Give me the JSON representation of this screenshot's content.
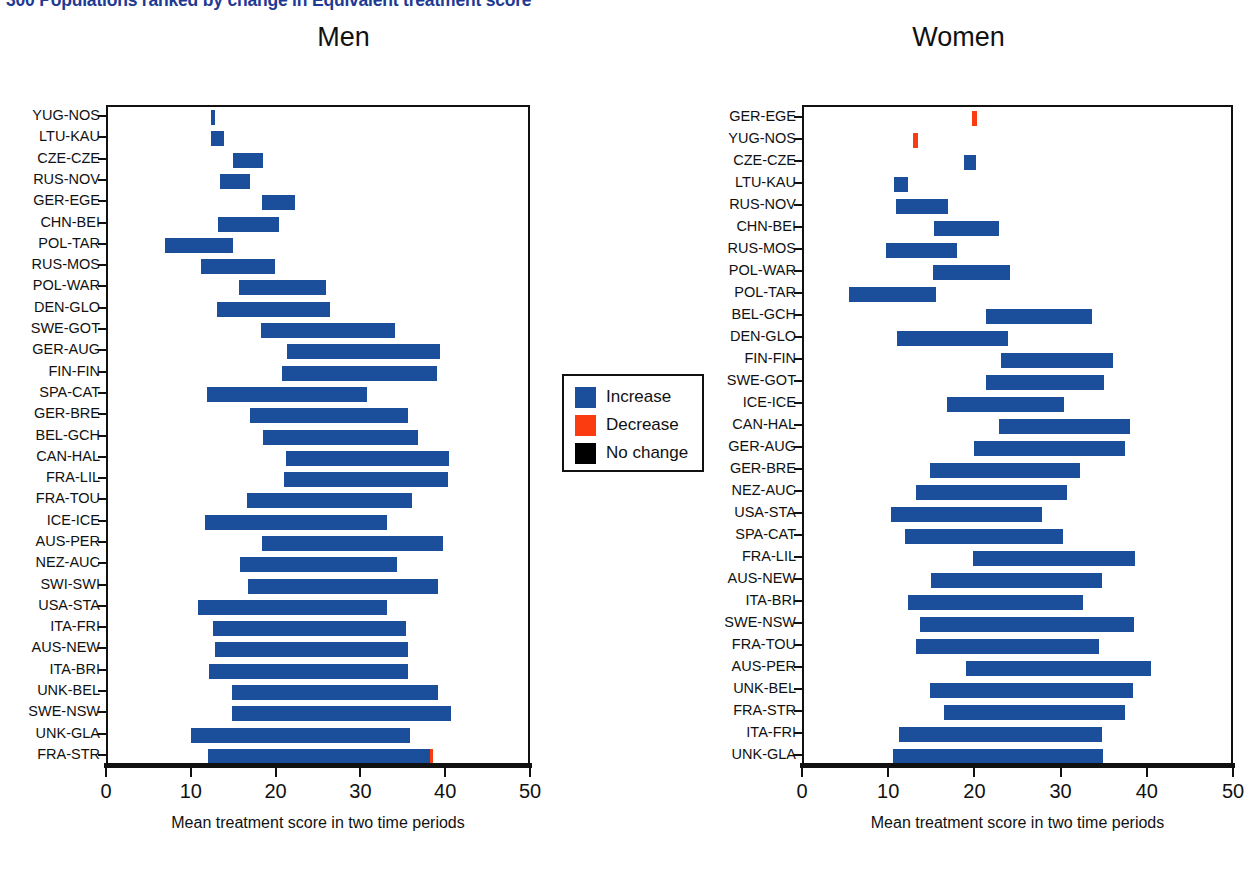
{
  "slide": {
    "title": "300 Populations ranked by change in Equivalent treatment score"
  },
  "panels": [
    {
      "key": "men",
      "heading": "Men"
    },
    {
      "key": "women",
      "heading": "Women"
    }
  ],
  "axis": {
    "x_title": "Mean  treatment score in two time periods",
    "ticks": [
      "0",
      "10",
      "20",
      "30",
      "40",
      "50"
    ],
    "tick_values": [
      0,
      10,
      20,
      30,
      40,
      50
    ],
    "xlim": [
      0,
      50
    ]
  },
  "legend": {
    "items": [
      {
        "label": "Increase",
        "color": "#1b4e9b"
      },
      {
        "label": "Decrease",
        "color": "#fa3c10"
      },
      {
        "label": "No change",
        "color": "#000000"
      }
    ]
  },
  "chart_data": {
    "type": "bar",
    "title": "300 Populations ranked by change in Equivalent treatment score",
    "xlabel": "Mean  treatment score in two time periods",
    "ylabel": "",
    "xlim": [
      0,
      50
    ],
    "grid": false,
    "legend_position": "center",
    "orientation": "horizontal",
    "bar_kind": "range (start = period 1 mean, end = period 2 mean)",
    "panels": [
      {
        "name": "Men",
        "categories": [
          "YUG-NOS",
          "LTU-KAU",
          "CZE-CZE",
          "RUS-NOV",
          "GER-EGE",
          "CHN-BEI",
          "POL-TAR",
          "RUS-MOS",
          "POL-WAR",
          "DEN-GLO",
          "SWE-GOT",
          "GER-AUG",
          "FIN-FIN",
          "SPA-CAT",
          "GER-BRE",
          "BEL-GCH",
          "CAN-HAL",
          "FRA-LIL",
          "FRA-TOU",
          "ICE-ICE",
          "AUS-PER",
          "NEZ-AUC",
          "SWI-SWI",
          "USA-STA",
          "ITA-FRI",
          "AUS-NEW",
          "ITA-BRI",
          "UNK-BEL",
          "SWE-NSW",
          "UNK-GLA",
          "FRA-STR"
        ],
        "bars": [
          {
            "label": "YUG-NOS",
            "start": 12.4,
            "end": 12.9,
            "direction": "increase"
          },
          {
            "label": "LTU-KAU",
            "start": 12.4,
            "end": 13.9,
            "direction": "increase"
          },
          {
            "label": "CZE-CZE",
            "start": 15.0,
            "end": 18.5,
            "direction": "increase"
          },
          {
            "label": "RUS-NOV",
            "start": 13.5,
            "end": 17.0,
            "direction": "increase"
          },
          {
            "label": "GER-EGE",
            "start": 18.4,
            "end": 22.3,
            "direction": "increase"
          },
          {
            "label": "CHN-BEI",
            "start": 13.2,
            "end": 20.4,
            "direction": "increase"
          },
          {
            "label": "POL-TAR",
            "start": 7.0,
            "end": 15.0,
            "direction": "increase"
          },
          {
            "label": "RUS-MOS",
            "start": 11.2,
            "end": 19.9,
            "direction": "increase"
          },
          {
            "label": "POL-WAR",
            "start": 15.7,
            "end": 25.9,
            "direction": "increase"
          },
          {
            "label": "DEN-GLO",
            "start": 13.1,
            "end": 26.4,
            "direction": "increase"
          },
          {
            "label": "SWE-GOT",
            "start": 18.3,
            "end": 34.1,
            "direction": "increase"
          },
          {
            "label": "GER-AUG",
            "start": 21.4,
            "end": 39.4,
            "direction": "increase"
          },
          {
            "label": "FIN-FIN",
            "start": 20.7,
            "end": 39.0,
            "direction": "increase"
          },
          {
            "label": "SPA-CAT",
            "start": 11.9,
            "end": 30.8,
            "direction": "increase"
          },
          {
            "label": "GER-BRE",
            "start": 17.0,
            "end": 35.6,
            "direction": "increase"
          },
          {
            "label": "BEL-GCH",
            "start": 18.5,
            "end": 36.8,
            "direction": "increase"
          },
          {
            "label": "CAN-HAL",
            "start": 21.2,
            "end": 40.4,
            "direction": "increase"
          },
          {
            "label": "FRA-LIL",
            "start": 21.0,
            "end": 40.3,
            "direction": "increase"
          },
          {
            "label": "FRA-TOU",
            "start": 16.6,
            "end": 36.1,
            "direction": "increase"
          },
          {
            "label": "ICE-ICE",
            "start": 11.7,
            "end": 33.1,
            "direction": "increase"
          },
          {
            "label": "AUS-PER",
            "start": 18.4,
            "end": 39.7,
            "direction": "increase"
          },
          {
            "label": "NEZ-AUC",
            "start": 15.8,
            "end": 34.3,
            "direction": "increase"
          },
          {
            "label": "SWI-SWI",
            "start": 16.8,
            "end": 39.2,
            "direction": "increase"
          },
          {
            "label": "USA-STA",
            "start": 10.9,
            "end": 33.1,
            "direction": "increase"
          },
          {
            "label": "ITA-FRI",
            "start": 12.6,
            "end": 35.4,
            "direction": "increase"
          },
          {
            "label": "AUS-NEW",
            "start": 12.8,
            "end": 35.6,
            "direction": "increase"
          },
          {
            "label": "ITA-BRI",
            "start": 12.1,
            "end": 35.6,
            "direction": "increase"
          },
          {
            "label": "UNK-BEL",
            "start": 14.8,
            "end": 39.2,
            "direction": "increase"
          },
          {
            "label": "SWE-NSW",
            "start": 14.9,
            "end": 40.7,
            "direction": "increase"
          },
          {
            "label": "UNK-GLA",
            "start": 10.0,
            "end": 35.8,
            "direction": "increase"
          },
          {
            "label": "FRA-STR",
            "start": 12.0,
            "end": 38.2,
            "direction": "increase",
            "tail_decrease": 38.6
          }
        ]
      },
      {
        "name": "Women",
        "categories": [
          "GER-EGE",
          "YUG-NOS",
          "CZE-CZE",
          "LTU-KAU",
          "RUS-NOV",
          "CHN-BEI",
          "RUS-MOS",
          "POL-WAR",
          "POL-TAR",
          "BEL-GCH",
          "DEN-GLO",
          "FIN-FIN",
          "SWE-GOT",
          "ICE-ICE",
          "CAN-HAL",
          "GER-AUG",
          "GER-BRE",
          "NEZ-AUC",
          "USA-STA",
          "SPA-CAT",
          "FRA-LIL",
          "AUS-NEW",
          "ITA-BRI",
          "SWE-NSW",
          "FRA-TOU",
          "AUS-PER",
          "UNK-BEL",
          "FRA-STR",
          "ITA-FRI",
          "UNK-GLA"
        ],
        "bars": [
          {
            "label": "GER-EGE",
            "start": 19.7,
            "end": 20.3,
            "direction": "decrease"
          },
          {
            "label": "YUG-NOS",
            "start": 12.9,
            "end": 13.5,
            "direction": "decrease"
          },
          {
            "label": "CZE-CZE",
            "start": 18.8,
            "end": 20.2,
            "direction": "increase"
          },
          {
            "label": "LTU-KAU",
            "start": 10.7,
            "end": 12.3,
            "direction": "increase"
          },
          {
            "label": "RUS-NOV",
            "start": 10.9,
            "end": 16.9,
            "direction": "increase"
          },
          {
            "label": "CHN-BEI",
            "start": 15.3,
            "end": 22.8,
            "direction": "increase"
          },
          {
            "label": "RUS-MOS",
            "start": 9.8,
            "end": 18.0,
            "direction": "increase"
          },
          {
            "label": "POL-WAR",
            "start": 15.2,
            "end": 24.1,
            "direction": "increase"
          },
          {
            "label": "POL-TAR",
            "start": 5.5,
            "end": 15.5,
            "direction": "increase"
          },
          {
            "label": "BEL-GCH",
            "start": 21.4,
            "end": 33.7,
            "direction": "increase"
          },
          {
            "label": "DEN-GLO",
            "start": 11.0,
            "end": 23.9,
            "direction": "increase"
          },
          {
            "label": "FIN-FIN",
            "start": 23.1,
            "end": 36.1,
            "direction": "increase"
          },
          {
            "label": "SWE-GOT",
            "start": 21.3,
            "end": 35.0,
            "direction": "increase"
          },
          {
            "label": "ICE-ICE",
            "start": 16.8,
            "end": 30.4,
            "direction": "increase"
          },
          {
            "label": "CAN-HAL",
            "start": 22.8,
            "end": 38.1,
            "direction": "increase"
          },
          {
            "label": "GER-AUG",
            "start": 20.0,
            "end": 37.5,
            "direction": "increase"
          },
          {
            "label": "GER-BRE",
            "start": 14.8,
            "end": 32.2,
            "direction": "increase"
          },
          {
            "label": "NEZ-AUC",
            "start": 13.2,
            "end": 30.8,
            "direction": "increase"
          },
          {
            "label": "USA-STA",
            "start": 10.3,
            "end": 27.8,
            "direction": "increase"
          },
          {
            "label": "SPA-CAT",
            "start": 12.0,
            "end": 30.3,
            "direction": "increase"
          },
          {
            "label": "FRA-LIL",
            "start": 19.8,
            "end": 38.6,
            "direction": "increase"
          },
          {
            "label": "AUS-NEW",
            "start": 15.0,
            "end": 34.8,
            "direction": "increase"
          },
          {
            "label": "ITA-BRI",
            "start": 12.3,
            "end": 32.6,
            "direction": "increase"
          },
          {
            "label": "SWE-NSW",
            "start": 13.7,
            "end": 38.5,
            "direction": "increase"
          },
          {
            "label": "FRA-TOU",
            "start": 13.2,
            "end": 34.5,
            "direction": "increase"
          },
          {
            "label": "AUS-PER",
            "start": 19.0,
            "end": 40.5,
            "direction": "increase"
          },
          {
            "label": "UNK-BEL",
            "start": 14.9,
            "end": 38.4,
            "direction": "increase"
          },
          {
            "label": "FRA-STR",
            "start": 16.5,
            "end": 37.5,
            "direction": "increase"
          },
          {
            "label": "ITA-FRI",
            "start": 11.2,
            "end": 34.8,
            "direction": "increase"
          },
          {
            "label": "UNK-GLA",
            "start": 10.5,
            "end": 34.9,
            "direction": "increase"
          }
        ]
      }
    ]
  }
}
